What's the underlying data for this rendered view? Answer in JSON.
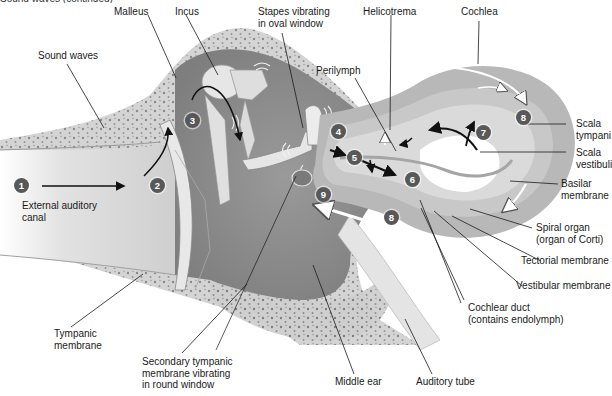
{
  "figure": {
    "cut_off_header": "Sound waves (continued)",
    "labels": {
      "malleus": "Malleus",
      "incus": "Incus",
      "stapes": "Stapes vibrating\nin oval window",
      "helicotrema": "Helicotrema",
      "cochlea": "Cochlea",
      "sound_waves": "Sound waves",
      "perilymph": "Perilymph",
      "scala_tympani": "Scala\ntympani",
      "scala_vestibuli": "Scala\nvestibuli",
      "basilar_membrane": "Basilar\nmembrane",
      "spiral_organ": "Spiral organ\n(organ of Corti)",
      "tectorial_membrane": "Tectorial membrane",
      "vestibular_membrane": "Vestibular membrane",
      "cochlear_duct": "Cochlear duct\n(contains endolymph)",
      "external_auditory_canal": "External auditory\ncanal",
      "tympanic_membrane": "Tympanic\nmembrane",
      "secondary_tympanic_membrane": "Secondary tympanic\nmembrane vibrating\nin round window",
      "middle_ear": "Middle ear",
      "auditory_tube": "Auditory tube"
    },
    "steps": [
      "1",
      "2",
      "3",
      "4",
      "5",
      "6",
      "7",
      "8",
      "8",
      "9"
    ],
    "colors": {
      "badge": "#585858",
      "badge_text": "#ffffff",
      "leader_line": "#1a1a1a",
      "bone": "#c9c9c9",
      "cavity": "#8f8f8f",
      "cochlea_outer": "#b4b4b4",
      "cochlea_inner": "#dcdcdc"
    }
  }
}
